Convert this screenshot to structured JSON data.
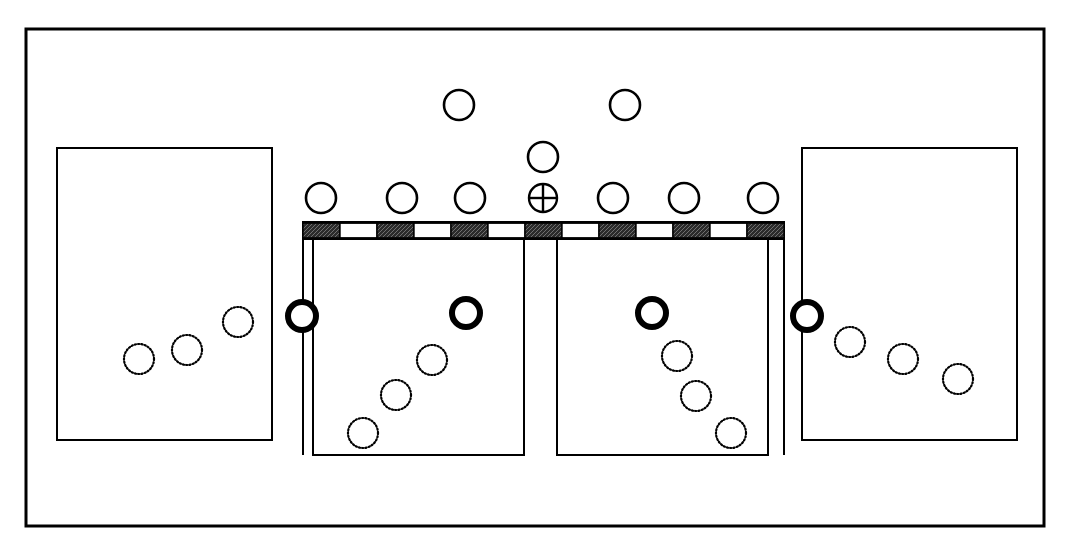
{
  "figure": {
    "name": "schematic-layout-diagram",
    "background_color": "#ffffff",
    "stroke_color": "#000000",
    "canvas": {
      "width": 1070,
      "height": 547
    }
  },
  "outer_frame": {
    "name": "outer-frame",
    "x": 26,
    "y": 29,
    "width": 1018,
    "height": 497,
    "stroke_width": 3
  },
  "rectangles": [
    {
      "name": "left-outer-rectangle",
      "x": 57,
      "y": 148,
      "width": 215,
      "height": 292,
      "stroke_width": 2
    },
    {
      "name": "left-inner-rectangle",
      "x": 313,
      "y": 238,
      "width": 211,
      "height": 217,
      "stroke_width": 2
    },
    {
      "name": "right-inner-rectangle",
      "x": 557,
      "y": 238,
      "width": 211,
      "height": 217,
      "stroke_width": 2
    },
    {
      "name": "right-outer-rectangle",
      "x": 802,
      "y": 148,
      "width": 215,
      "height": 292,
      "stroke_width": 2
    }
  ],
  "hatched_bar": {
    "name": "hatched-bar",
    "x": 303,
    "y": 222,
    "width": 481,
    "height": 17,
    "stroke_width": 2,
    "segment_count": 13,
    "fill_pattern": "alternating-dark-hatch-and-white",
    "dark_fill": "#2b2b2b",
    "light_fill": "#ffffff"
  },
  "drop_lines": [
    {
      "name": "drop-line-left",
      "x": 313,
      "y1": 239,
      "y2": 258
    },
    {
      "name": "drop-line-center-left",
      "x": 524,
      "y1": 239,
      "y2": 258
    },
    {
      "name": "drop-line-center-right",
      "x": 557,
      "y1": 239,
      "y2": 258
    },
    {
      "name": "drop-line-right",
      "x": 768,
      "y1": 239,
      "y2": 258
    }
  ],
  "connector_lines": [
    {
      "name": "connector-line-left",
      "x": 303,
      "y1": 239,
      "y2": 455
    },
    {
      "name": "connector-line-right",
      "x": 784,
      "y1": 239,
      "y2": 455
    }
  ],
  "circles": {
    "thin_open": [
      {
        "name": "top-circle-1",
        "cx": 459,
        "cy": 105,
        "r": 15,
        "stroke_width": 2.6
      },
      {
        "name": "top-circle-2",
        "cx": 625,
        "cy": 105,
        "r": 15,
        "stroke_width": 2.6
      },
      {
        "name": "mid-circle-1",
        "cx": 543,
        "cy": 157,
        "r": 15,
        "stroke_width": 2.6
      },
      {
        "name": "row-circle-1",
        "cx": 321,
        "cy": 198,
        "r": 15,
        "stroke_width": 2.6
      },
      {
        "name": "row-circle-2",
        "cx": 402,
        "cy": 198,
        "r": 15,
        "stroke_width": 2.6
      },
      {
        "name": "row-circle-3",
        "cx": 470,
        "cy": 198,
        "r": 15,
        "stroke_width": 2.6
      },
      {
        "name": "row-circle-5",
        "cx": 613,
        "cy": 198,
        "r": 15,
        "stroke_width": 2.6
      },
      {
        "name": "row-circle-6",
        "cx": 684,
        "cy": 198,
        "r": 15,
        "stroke_width": 2.6
      },
      {
        "name": "row-circle-7",
        "cx": 763,
        "cy": 198,
        "r": 15,
        "stroke_width": 2.6
      }
    ],
    "crosshair": [
      {
        "name": "crosshair-circle-center",
        "cx": 543,
        "cy": 198,
        "r": 14,
        "stroke_width": 2.4
      }
    ],
    "bold_open": [
      {
        "name": "bold-circle-far-left",
        "cx": 302,
        "cy": 316,
        "r": 14,
        "stroke_width": 6
      },
      {
        "name": "bold-circle-inner-left",
        "cx": 466,
        "cy": 313,
        "r": 14,
        "stroke_width": 6
      },
      {
        "name": "bold-circle-inner-right",
        "cx": 652,
        "cy": 313,
        "r": 14,
        "stroke_width": 6
      },
      {
        "name": "bold-circle-far-right",
        "cx": 807,
        "cy": 316,
        "r": 14,
        "stroke_width": 6
      }
    ],
    "dotted": [
      {
        "name": "dotted-circle-left-a",
        "cx": 139,
        "cy": 359,
        "r": 15
      },
      {
        "name": "dotted-circle-left-b",
        "cx": 187,
        "cy": 350,
        "r": 15
      },
      {
        "name": "dotted-circle-left-c",
        "cx": 238,
        "cy": 322,
        "r": 15
      },
      {
        "name": "dotted-circle-inner-left-a",
        "cx": 432,
        "cy": 360,
        "r": 15
      },
      {
        "name": "dotted-circle-inner-left-b",
        "cx": 396,
        "cy": 395,
        "r": 15
      },
      {
        "name": "dotted-circle-inner-left-c",
        "cx": 363,
        "cy": 433,
        "r": 15
      },
      {
        "name": "dotted-circle-inner-right-a",
        "cx": 677,
        "cy": 356,
        "r": 15
      },
      {
        "name": "dotted-circle-inner-right-b",
        "cx": 696,
        "cy": 396,
        "r": 15
      },
      {
        "name": "dotted-circle-inner-right-c",
        "cx": 731,
        "cy": 433,
        "r": 15
      },
      {
        "name": "dotted-circle-right-a",
        "cx": 850,
        "cy": 342,
        "r": 15
      },
      {
        "name": "dotted-circle-right-b",
        "cx": 903,
        "cy": 359,
        "r": 15
      },
      {
        "name": "dotted-circle-right-c",
        "cx": 958,
        "cy": 379,
        "r": 15
      }
    ]
  }
}
